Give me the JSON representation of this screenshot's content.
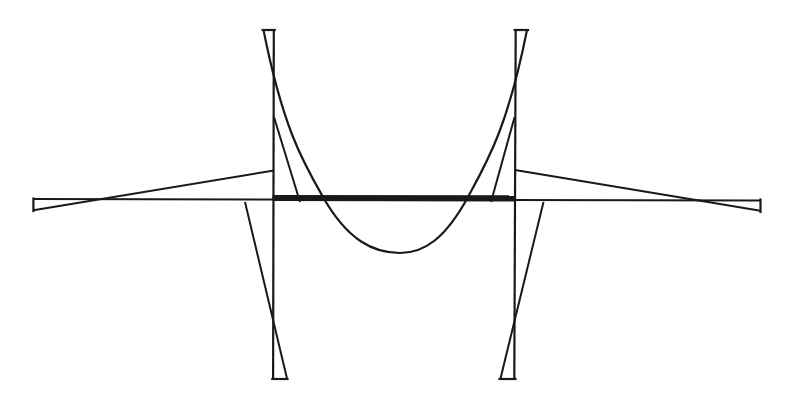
{
  "canvas": {
    "width": 793,
    "height": 400,
    "background": "#ffffff",
    "ink": "#191919"
  },
  "figure": {
    "kind": "line-diagram",
    "elements": [
      {
        "name": "x-axis-line",
        "type": "line",
        "x1": 33.4,
        "y1": 199,
        "x2": 760.5,
        "y2": 200.4,
        "w": 2
      },
      {
        "name": "interval-bar",
        "type": "line",
        "x1": 272.5,
        "y1": 198,
        "x2": 516,
        "y2": 198.3,
        "w": 6.2
      },
      {
        "name": "function-curve",
        "type": "path",
        "d": "M 263.5 30 C 283 128, 303 162, 323 197 C 348 241, 374 253, 400 253 C 424 253, 445 239, 468 197 C 487 162, 507.5 128, 527 30",
        "w": 2.2
      },
      {
        "name": "left-strip-vertical",
        "type": "line",
        "x1": 273.8,
        "y1": 30,
        "x2": 273.1,
        "y2": 379,
        "w": 2.2
      },
      {
        "name": "left-strip-top-cap",
        "type": "line",
        "x1": 262.6,
        "y1": 30,
        "x2": 274.8,
        "y2": 30,
        "w": 2.2,
        "cap": "square"
      },
      {
        "name": "left-strip-bottom-cap",
        "type": "line",
        "x1": 272.3,
        "y1": 379,
        "x2": 287.5,
        "y2": 379,
        "w": 2.2,
        "cap": "square"
      },
      {
        "name": "left-lower-slope-line",
        "type": "line",
        "x1": 245,
        "y1": 202,
        "x2": 287,
        "y2": 378.5,
        "w": 2
      },
      {
        "name": "left-fan-line",
        "type": "line",
        "x1": 274,
        "y1": 117,
        "x2": 300,
        "y2": 202,
        "w": 2
      },
      {
        "name": "right-strip-vertical",
        "type": "line",
        "x1": 515.7,
        "y1": 30,
        "x2": 514.3,
        "y2": 379,
        "w": 2.2
      },
      {
        "name": "right-strip-top-cap",
        "type": "line",
        "x1": 514.7,
        "y1": 30,
        "x2": 528,
        "y2": 30,
        "w": 2.2,
        "cap": "square"
      },
      {
        "name": "right-strip-bottom-cap",
        "type": "line",
        "x1": 499.5,
        "y1": 379,
        "x2": 515.5,
        "y2": 379,
        "w": 2.2,
        "cap": "square"
      },
      {
        "name": "right-lower-slope-line",
        "type": "line",
        "x1": 543.5,
        "y1": 202,
        "x2": 500.5,
        "y2": 378.5,
        "w": 2
      },
      {
        "name": "right-fan-line",
        "type": "line",
        "x1": 514.6,
        "y1": 117,
        "x2": 491,
        "y2": 202,
        "w": 2
      },
      {
        "name": "left-shallow-slope-line",
        "type": "line",
        "x1": 33.4,
        "y1": 210.3,
        "x2": 274,
        "y2": 170.5,
        "w": 2
      },
      {
        "name": "left-axis-end-cap",
        "type": "line",
        "x1": 33.4,
        "y1": 198.5,
        "x2": 33.4,
        "y2": 211,
        "w": 2.2,
        "cap": "square"
      },
      {
        "name": "right-shallow-slope-line",
        "type": "line",
        "x1": 515,
        "y1": 170,
        "x2": 760.5,
        "y2": 210.8,
        "w": 2
      },
      {
        "name": "right-axis-end-cap",
        "type": "line",
        "x1": 760.5,
        "y1": 199.5,
        "x2": 760.5,
        "y2": 212,
        "w": 2.2,
        "cap": "square"
      }
    ]
  }
}
